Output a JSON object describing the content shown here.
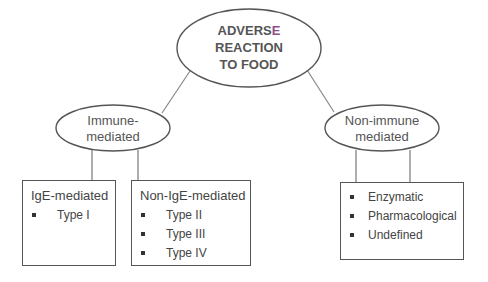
{
  "root": {
    "line1": "ADVERS",
    "line1_accent": "E",
    "line2": "REACTION",
    "line3": "TO FOOD"
  },
  "branches": [
    {
      "label_line1": "Immune-",
      "label_line2": "mediated",
      "boxes": [
        {
          "title": "IgE-mediated",
          "items": [
            "Type I"
          ]
        },
        {
          "title": "Non-IgE-mediated",
          "items": [
            "Type II",
            "Type III",
            "Type IV"
          ]
        }
      ]
    },
    {
      "label_line1": "Non-immune",
      "label_line2": "mediated",
      "boxes": [
        {
          "title": "",
          "items": [
            "Enzymatic",
            "Pharmacological",
            "Undefined"
          ]
        }
      ]
    }
  ],
  "colors": {
    "line": "#777777",
    "border": "#555555",
    "accent": "#8e4f8a"
  }
}
